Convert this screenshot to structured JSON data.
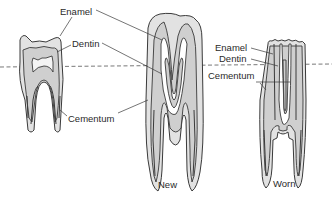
{
  "diagram": {
    "type": "anatomical-illustration",
    "teeth": [
      {
        "id": "low-crowned",
        "label": ""
      },
      {
        "id": "new",
        "label": "New"
      },
      {
        "id": "worn",
        "label": "Worn"
      }
    ],
    "labels": {
      "left_enamel": "Enamel",
      "left_dentin": "Dentin",
      "left_cementum": "Cementum",
      "right_enamel": "Enamel",
      "right_dentin": "Dentin",
      "right_cementum": "Cementum",
      "new": "New",
      "worn": "Worn"
    },
    "reference_line": "dashed gum line",
    "colors": {
      "stroke": "#3a3a3a",
      "enamel": "#e2e2e2",
      "dentin": "#cfcfcf",
      "background": "#ffffff"
    }
  }
}
